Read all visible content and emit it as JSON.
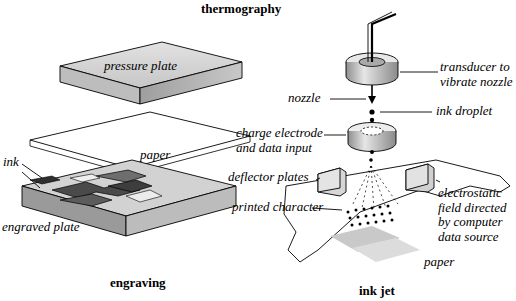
{
  "figure": {
    "title_top": "thermography",
    "caption_left": "engraving",
    "caption_right": "ink jet"
  },
  "engraving": {
    "pressure_plate": "pressure plate",
    "paper": "paper",
    "ink": "ink",
    "engraved_plate": "engraved plate"
  },
  "inkjet": {
    "transducer": "transducer to vibrate nozzle",
    "nozzle": "nozzle",
    "ink_droplet": "ink droplet",
    "charge_electrode": "charge electrode and data input",
    "deflector_plates": "deflector plates",
    "printed_character": "printed character",
    "electrostatic_field": "electrostatic field directed by computer data source",
    "paper": "paper"
  },
  "colors": {
    "outline": "#000000",
    "plate_top": "#d9d9d9",
    "plate_side": "#b5b5b5",
    "plate_front": "#c9c9c9",
    "ink_dark": "#3a3a3a",
    "ink_mid": "#6b6b6b",
    "paper_white": "#ffffff",
    "shadow_gray": "#c4c4c4",
    "nozzle_gray": "#bfbfbf",
    "nozzle_dark": "#8a8a8a"
  }
}
